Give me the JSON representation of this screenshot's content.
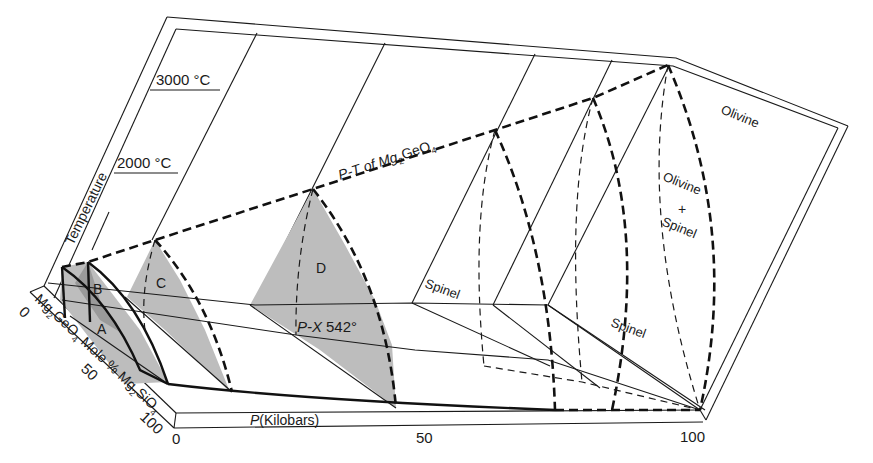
{
  "figure": {
    "axes": {
      "temperature": {
        "label": "Temperature",
        "ticks": [
          {
            "label": "2000 °C"
          },
          {
            "label": "3000 °C"
          }
        ]
      },
      "composition": {
        "label_prefix": "Mg",
        "label_sub1": "2",
        "label_mid": "GeO",
        "label_sub2": "4",
        "label_mid2": " Mole % Mg",
        "label_sub3": "2",
        "label_end": "SiO",
        "label_sub4": "4",
        "ticks": [
          "0",
          "50",
          "100"
        ]
      },
      "pressure": {
        "label_italic": "P",
        "label_rest": "(Kilobars)",
        "ticks": [
          "0",
          "50",
          "100"
        ]
      }
    },
    "curve_labels": {
      "pt_prefix": "P-T of Mg",
      "pt_sub1": "2",
      "pt_mid": "GeO",
      "pt_sub2": "4",
      "px_italic": "P-X",
      "px_value": "542°"
    },
    "regions": {
      "A": "A",
      "B": "B",
      "C": "C",
      "D": "D",
      "spinel_1": "Spinel",
      "spinel_2": "Spinel",
      "olivine": "Olivine",
      "olivine_spinel_1": "Olivine",
      "olivine_spinel_plus": "+",
      "olivine_spinel_2": "Spinel"
    },
    "colors": {
      "ink": "#1a1a1a",
      "shade": "#bdbdbd",
      "shade_dark": "#9a9a9a",
      "background": "#ffffff"
    }
  }
}
